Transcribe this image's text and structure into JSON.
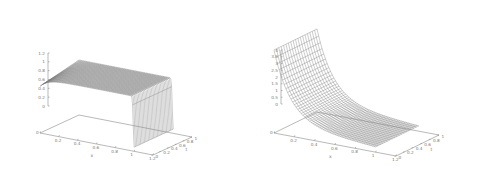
{
  "chart_data": [
    {
      "type": "surface",
      "title": "",
      "xlabel": "x",
      "ylabel": "t",
      "zlabel": "",
      "xlim": [
        0,
        1.2
      ],
      "ylim": [
        0,
        1
      ],
      "zlim": [
        0,
        1.2
      ],
      "x_ticks": [
        "0",
        "0.2",
        "0.4",
        "0.6",
        "0.8",
        "1",
        "1.2"
      ],
      "y_ticks": [
        "0",
        "0.2",
        "0.4",
        "0.6",
        "0.8",
        "1"
      ],
      "z_ticks": [
        "0",
        "0.2",
        "0.4",
        "0.6",
        "0.8",
        "1",
        "1.2"
      ],
      "description": "Surface near 1 for x < ~1, dropping sharply to 0 near x = 1 (step-like front); plateau region with slight curvature at small t",
      "samples": {
        "x": [
          0,
          0.2,
          0.4,
          0.6,
          0.8,
          0.95,
          1.0
        ],
        "z_at_t1": [
          1,
          1,
          1,
          1,
          1,
          1,
          0
        ]
      },
      "grid": false
    },
    {
      "type": "surface",
      "title": "",
      "xlabel": "x",
      "ylabel": "t",
      "zlabel": "",
      "xlim": [
        0,
        1.2
      ],
      "ylim": [
        0,
        1
      ],
      "zlim": [
        0,
        4
      ],
      "x_ticks": [
        "0",
        "0.2",
        "0.4",
        "0.6",
        "0.8",
        "1",
        "1.2"
      ],
      "y_ticks": [
        "0",
        "0.2",
        "0.4",
        "0.6",
        "0.8",
        "1"
      ],
      "z_ticks": [
        "0",
        "0.5",
        "1",
        "1.5",
        "2",
        "2.5",
        "3",
        "3.5",
        "4"
      ],
      "description": "Surface decaying from ~3.7 at x = 0 toward ~0.3 at x = 1, with a steep rise near x = 0 (boundary layer); surface shape roughly constant in t",
      "samples": {
        "x": [
          0,
          0.05,
          0.1,
          0.2,
          0.4,
          0.6,
          0.8,
          1.0
        ],
        "z": [
          3.7,
          2.6,
          2.0,
          1.4,
          0.9,
          0.6,
          0.45,
          0.3
        ]
      },
      "grid": false
    }
  ],
  "plots": {
    "left": {
      "z_ticks": [
        "1.2",
        "1",
        "0.8",
        "0.6",
        "0.4",
        "0.2",
        "0"
      ],
      "x_ticks": [
        "0",
        "0.2",
        "0.4",
        "0.6",
        "0.8",
        "1",
        "1.2"
      ],
      "y_ticks": [
        "0",
        "0.2",
        "0.4",
        "0.6",
        "0.8",
        "1"
      ],
      "x_label": "x",
      "y_label": "t"
    },
    "right": {
      "z_ticks": [
        "4",
        "3.5",
        "3",
        "2.5",
        "2",
        "1.5",
        "1",
        "0.5",
        "0"
      ],
      "x_ticks": [
        "0",
        "0.2",
        "0.4",
        "0.6",
        "0.8",
        "1",
        "1.2"
      ],
      "y_ticks": [
        "0",
        "0.2",
        "0.4",
        "0.6",
        "0.8",
        "1"
      ],
      "x_label": "x",
      "y_label": "t"
    }
  }
}
